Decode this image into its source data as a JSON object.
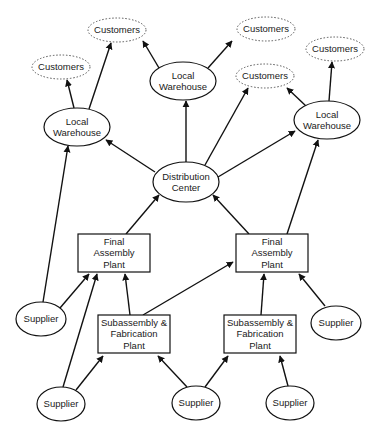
{
  "diagram": {
    "title": "",
    "nodes": [
      {
        "id": "cust1",
        "label": [
          "Customers"
        ],
        "shape": "dotted-ellipse",
        "x": 117,
        "y": 30,
        "rx": 29,
        "ry": 12
      },
      {
        "id": "cust2",
        "label": [
          "Customers"
        ],
        "shape": "dotted-ellipse",
        "x": 61,
        "y": 67,
        "rx": 29,
        "ry": 12
      },
      {
        "id": "cust3",
        "label": [
          "Customers"
        ],
        "shape": "dotted-ellipse",
        "x": 266,
        "y": 29,
        "rx": 29,
        "ry": 12
      },
      {
        "id": "cust4",
        "label": [
          "Customers"
        ],
        "shape": "dotted-ellipse",
        "x": 265,
        "y": 76,
        "rx": 29,
        "ry": 12
      },
      {
        "id": "cust5",
        "label": [
          "Customers"
        ],
        "shape": "dotted-ellipse",
        "x": 335,
        "y": 49,
        "rx": 29,
        "ry": 12
      },
      {
        "id": "lw1",
        "label": [
          "Local",
          "Warehouse"
        ],
        "shape": "ellipse",
        "x": 77,
        "y": 127,
        "rx": 33,
        "ry": 19
      },
      {
        "id": "lw2",
        "label": [
          "Local",
          "Warehouse"
        ],
        "shape": "ellipse",
        "x": 183,
        "y": 81,
        "rx": 33,
        "ry": 19
      },
      {
        "id": "lw3",
        "label": [
          "Local",
          "Warehouse"
        ],
        "shape": "ellipse",
        "x": 327,
        "y": 120,
        "rx": 33,
        "ry": 19
      },
      {
        "id": "dc",
        "label": [
          "Distribution",
          "Center"
        ],
        "shape": "ellipse",
        "x": 186,
        "y": 182,
        "rx": 33,
        "ry": 20
      },
      {
        "id": "fap1",
        "label": [
          "Final",
          "Assembly",
          "Plant"
        ],
        "shape": "box",
        "x": 114,
        "y": 253,
        "w": 72,
        "h": 38
      },
      {
        "id": "fap2",
        "label": [
          "Final",
          "Assembly",
          "Plant"
        ],
        "shape": "box",
        "x": 272,
        "y": 253,
        "w": 72,
        "h": 38
      },
      {
        "id": "sfp1",
        "label": [
          "Subassembly &",
          "Fabrication",
          "Plant"
        ],
        "shape": "box",
        "x": 134,
        "y": 334,
        "w": 72,
        "h": 38
      },
      {
        "id": "sfp2",
        "label": [
          "Subassembly &",
          "Fabrication",
          "Plant"
        ],
        "shape": "box",
        "x": 260,
        "y": 334,
        "w": 72,
        "h": 38
      },
      {
        "id": "sup1",
        "label": [
          "Supplier"
        ],
        "shape": "ellipse",
        "x": 41,
        "y": 319,
        "rx": 25,
        "ry": 17
      },
      {
        "id": "sup2",
        "label": [
          "Supplier"
        ],
        "shape": "ellipse",
        "x": 336,
        "y": 323,
        "rx": 25,
        "ry": 17
      },
      {
        "id": "sup3",
        "label": [
          "Supplier"
        ],
        "shape": "ellipse",
        "x": 61,
        "y": 404,
        "rx": 24,
        "ry": 17
      },
      {
        "id": "sup4",
        "label": [
          "Supplier"
        ],
        "shape": "ellipse",
        "x": 196,
        "y": 403,
        "rx": 24,
        "ry": 17
      },
      {
        "id": "sup5",
        "label": [
          "Supplier"
        ],
        "shape": "ellipse",
        "x": 290,
        "y": 403,
        "rx": 24,
        "ry": 17
      }
    ],
    "edges": [
      {
        "from": "lw1",
        "to": "cust2",
        "x1": 74,
        "y1": 108,
        "x2": 67,
        "y2": 80
      },
      {
        "from": "lw1",
        "to": "cust1",
        "x1": 89,
        "y1": 109,
        "x2": 111,
        "y2": 43
      },
      {
        "from": "lw2",
        "to": "cust1",
        "x1": 159,
        "y1": 68,
        "x2": 143,
        "y2": 41
      },
      {
        "from": "lw2",
        "to": "cust3",
        "x1": 208,
        "y1": 68,
        "x2": 232,
        "y2": 41
      },
      {
        "from": "lw3",
        "to": "cust4",
        "x1": 306,
        "y1": 106,
        "x2": 287,
        "y2": 88
      },
      {
        "from": "lw3",
        "to": "cust5",
        "x1": 329,
        "y1": 101,
        "x2": 332,
        "y2": 62
      },
      {
        "from": "dc",
        "to": "lw1",
        "x1": 155,
        "y1": 172,
        "x2": 106,
        "y2": 140
      },
      {
        "from": "dc",
        "to": "lw2",
        "x1": 186,
        "y1": 162,
        "x2": 186,
        "y2": 101
      },
      {
        "from": "dc",
        "to": "cust4",
        "x1": 205,
        "y1": 165,
        "x2": 248,
        "y2": 88
      },
      {
        "from": "dc",
        "to": "lw3",
        "x1": 218,
        "y1": 177,
        "x2": 295,
        "y2": 131
      },
      {
        "from": "fap1",
        "to": "dc",
        "x1": 126,
        "y1": 234,
        "x2": 159,
        "y2": 195
      },
      {
        "from": "fap2",
        "to": "dc",
        "x1": 249,
        "y1": 234,
        "x2": 213,
        "y2": 195
      },
      {
        "from": "fap2",
        "to": "lw3",
        "x1": 287,
        "y1": 234,
        "x2": 318,
        "y2": 140
      },
      {
        "from": "sup1",
        "to": "lw1",
        "x1": 43,
        "y1": 302,
        "x2": 68,
        "y2": 146
      },
      {
        "from": "sup1",
        "to": "fap1",
        "x1": 60,
        "y1": 308,
        "x2": 89,
        "y2": 274
      },
      {
        "from": "sup3",
        "to": "fap1",
        "x1": 63,
        "y1": 387,
        "x2": 97,
        "y2": 274
      },
      {
        "from": "sfp1",
        "to": "fap1",
        "x1": 130,
        "y1": 315,
        "x2": 125,
        "y2": 274
      },
      {
        "from": "sfp1",
        "to": "fap2",
        "x1": 143,
        "y1": 315,
        "x2": 233,
        "y2": 262
      },
      {
        "from": "sfp2",
        "to": "fap2",
        "x1": 261,
        "y1": 315,
        "x2": 264,
        "y2": 274
      },
      {
        "from": "sup2",
        "to": "fap2",
        "x1": 325,
        "y1": 306,
        "x2": 299,
        "y2": 274
      },
      {
        "from": "sup3",
        "to": "sfp1",
        "x1": 76,
        "y1": 390,
        "x2": 103,
        "y2": 356
      },
      {
        "from": "sup4",
        "to": "sfp1",
        "x1": 187,
        "y1": 387,
        "x2": 158,
        "y2": 356
      },
      {
        "from": "sup4",
        "to": "sfp2",
        "x1": 205,
        "y1": 387,
        "x2": 228,
        "y2": 356
      },
      {
        "from": "sup5",
        "to": "sfp2",
        "x1": 288,
        "y1": 386,
        "x2": 280,
        "y2": 356
      }
    ]
  }
}
